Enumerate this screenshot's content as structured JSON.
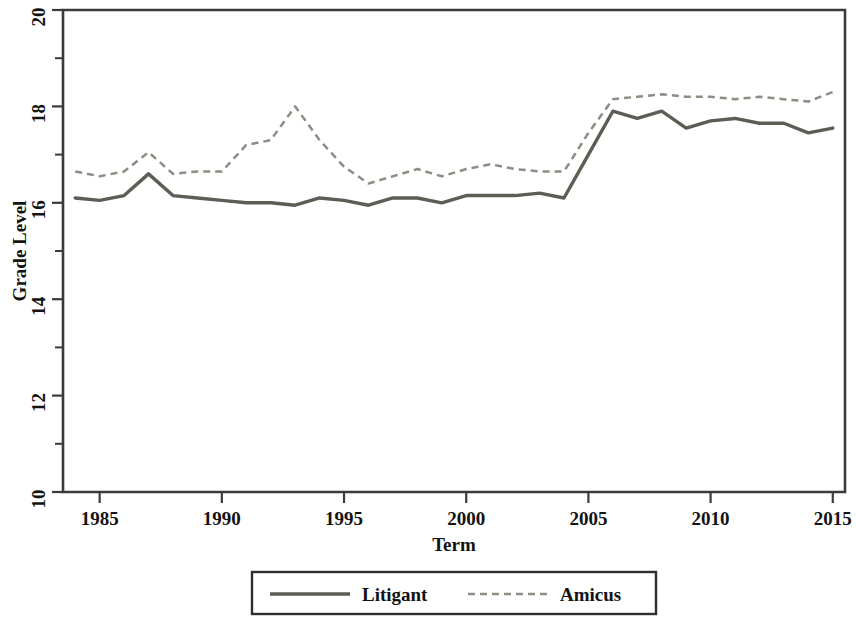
{
  "chart_data": {
    "type": "line",
    "title": "",
    "xlabel": "Term",
    "ylabel": "Grade Level",
    "xlim": [
      1983.5,
      2015.5
    ],
    "ylim": [
      10,
      20
    ],
    "xticks": [
      1985,
      1990,
      1995,
      2000,
      2005,
      2010,
      2015
    ],
    "xtick_labels": [
      "1985",
      "1990",
      "1995",
      "2000",
      "2005",
      "2010",
      "2015"
    ],
    "yticks": [
      10,
      12,
      14,
      16,
      18,
      20
    ],
    "ytick_labels": [
      "10",
      "12",
      "14",
      "16",
      "18",
      "20"
    ],
    "yminor_ticks": [
      11,
      13,
      15,
      17,
      19
    ],
    "grid": false,
    "legend_position": "below-outside",
    "x": [
      1984,
      1985,
      1986,
      1987,
      1988,
      1989,
      1990,
      1991,
      1992,
      1993,
      1994,
      1995,
      1996,
      1997,
      1998,
      1999,
      2000,
      2001,
      2002,
      2003,
      2004,
      2005,
      2006,
      2007,
      2008,
      2009,
      2010,
      2011,
      2012,
      2013,
      2014,
      2015
    ],
    "series": [
      {
        "name": "Litigant",
        "style": "solid",
        "color": "#5d5d55",
        "values": [
          16.1,
          16.05,
          16.15,
          16.6,
          16.15,
          16.1,
          16.05,
          16.0,
          16.0,
          15.95,
          16.1,
          16.05,
          15.95,
          16.1,
          16.1,
          16.0,
          16.15,
          16.15,
          16.15,
          16.2,
          16.1,
          17.0,
          17.9,
          17.75,
          17.9,
          17.55,
          17.7,
          17.75,
          17.65,
          17.65,
          17.45,
          17.55
        ]
      },
      {
        "name": "Amicus",
        "style": "dashed",
        "color": "#8d8d83",
        "values": [
          16.65,
          16.55,
          16.65,
          17.05,
          16.6,
          16.65,
          16.65,
          17.2,
          17.3,
          18.0,
          17.3,
          16.75,
          16.4,
          16.55,
          16.7,
          16.55,
          16.7,
          16.8,
          16.7,
          16.65,
          16.65,
          17.45,
          18.15,
          18.2,
          18.25,
          18.2,
          18.2,
          18.15,
          18.2,
          18.15,
          18.1,
          18.3
        ]
      }
    ]
  },
  "legend": {
    "items": [
      {
        "label": "Litigant",
        "style": "solid"
      },
      {
        "label": "Amicus",
        "style": "dashed"
      }
    ]
  }
}
